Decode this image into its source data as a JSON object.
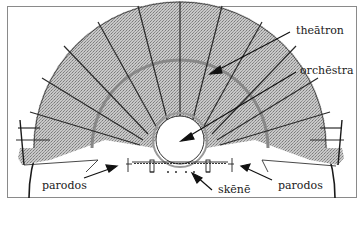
{
  "diagram": {
    "labels": {
      "theatron": "theātron",
      "orchestra": "orchēstra",
      "parodos_left": "parodos",
      "skene": "skēnē",
      "parodos_right": "parodos"
    },
    "colors": {
      "frame": "#8a8a8a",
      "seating_fill": "#bdbdbd",
      "lines": "#1a1a1a",
      "background": "#ffffff"
    }
  }
}
